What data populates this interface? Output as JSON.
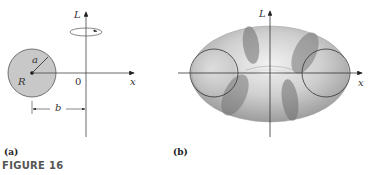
{
  "figure": {
    "caption": "FIGURE 16",
    "panels": [
      {
        "id": "a",
        "label": "(a)",
        "axis_labels": {
          "vertical": "L",
          "horizontal": "x",
          "origin": "0"
        },
        "circle_labels": {
          "center": "R",
          "radius": "a",
          "distance": "b"
        }
      },
      {
        "id": "b",
        "label": "(b)",
        "axis_labels": {
          "vertical": "L",
          "horizontal": "x"
        }
      }
    ]
  },
  "colors": {
    "disk_fill": "#c8c8c8",
    "torus_light": "#e4e4e4",
    "torus_mid": "#bdbdbd",
    "torus_dark": "#8a8a8a",
    "axis": "#444444"
  }
}
